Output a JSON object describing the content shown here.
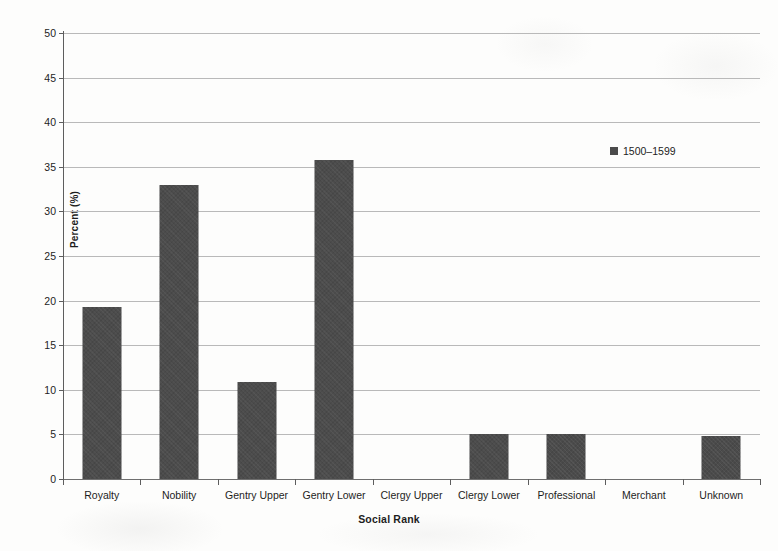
{
  "chart_data": {
    "type": "bar",
    "title": "",
    "xlabel": "Social Rank",
    "ylabel": "Percent (%)",
    "categories": [
      "Royalty",
      "Nobility",
      "Gentry Upper",
      "Gentry Lower",
      "Clergy Upper",
      "Clergy Lower",
      "Professional",
      "Merchant",
      "Unknown"
    ],
    "series": [
      {
        "name": "1500–1599",
        "values": [
          19.3,
          33.0,
          10.9,
          35.8,
          0,
          5.1,
          5.0,
          0,
          4.8
        ]
      }
    ],
    "ylim": [
      0,
      50
    ],
    "yticks": [
      0,
      5,
      10,
      15,
      20,
      25,
      30,
      35,
      40,
      45,
      50
    ],
    "ytick_labels": [
      "0",
      "5",
      "10",
      "15",
      "20",
      "25",
      "30",
      "35",
      "40",
      "45",
      "50"
    ],
    "grid": "horizontal",
    "legend_position": "upper-right-inside",
    "bar_color": "#4b4b4b",
    "gridline_color": "#b9b9b9",
    "axis_color": "#5d5d5d",
    "background_color": "#fdfdfc"
  },
  "legend": {
    "entries": [
      {
        "label": "1500–1599",
        "color": "#4b4b4b",
        "marker": "square-marker"
      }
    ]
  }
}
